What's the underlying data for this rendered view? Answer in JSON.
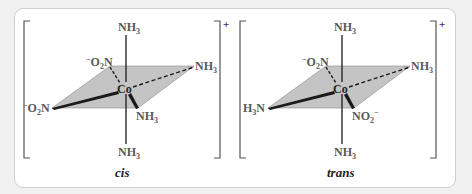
{
  "figure": {
    "charge": "+",
    "center_atom": "Co",
    "isomers": [
      {
        "caption": "cis",
        "ligands": {
          "axial_top": "NH3",
          "axial_bottom": "NH3",
          "back_left": "⁻O2N",
          "back_right": "NH3",
          "front_left": "⁻O2N",
          "front_right": "NH3"
        }
      },
      {
        "caption": "trans",
        "ligands": {
          "axial_top": "NH3",
          "axial_bottom": "NH3",
          "back_left": "⁻O2N",
          "back_right": "NH3",
          "front_left": "H3N",
          "front_right": "NO2⁻"
        }
      }
    ]
  },
  "colors": {
    "plane_fill": "#c4c4c4",
    "bond": "#1a1a1a",
    "label": "#5a5a5a",
    "bracket": "#555555"
  }
}
